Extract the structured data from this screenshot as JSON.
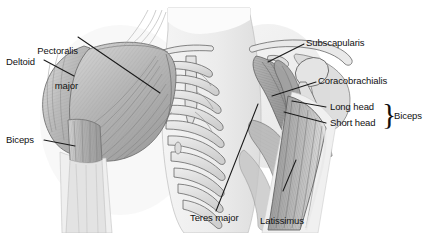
{
  "figure": {
    "background_color": "#ffffff",
    "label_color": "#111111",
    "leader_line_color": "#1a1a1a"
  },
  "labels": {
    "pectoralis_major_line1": "Pectoralis",
    "pectoralis_major_line2": "major",
    "deltoid": "Deltoid",
    "biceps_left": "Biceps",
    "subscapularis": "Subscapularis",
    "coracobrachialis": "Coracobrachialis",
    "long_head": "Long head",
    "short_head": "Short head",
    "biceps_brace": "Biceps",
    "brace_glyph": "}",
    "teres_major": "Teres major",
    "latissimus_dorsi_line1": "Latissimus",
    "latissimus_dorsi_line2": "dorsi"
  },
  "anatomy": {
    "structures": [
      "pectoralis major",
      "deltoid",
      "biceps brachii long head",
      "biceps brachii short head",
      "subscapularis",
      "coracobrachialis",
      "teres major",
      "latissimus dorsi",
      "rib cage",
      "clavicle",
      "scapula",
      "humerus",
      "sternum"
    ],
    "palette": {
      "muscle_light": "#c9c9c9",
      "muscle_mid": "#a9a9a9",
      "muscle_dark": "#8a8a8a",
      "bone_light": "#e6e6e6",
      "bone_fill": "#d8d8d8",
      "outline": "#555555",
      "skin_shadow": "#efefef"
    }
  }
}
